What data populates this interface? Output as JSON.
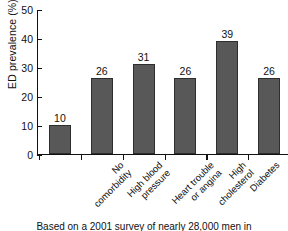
{
  "chart_data": {
    "type": "bar",
    "title": "",
    "xlabel": "",
    "ylabel": "ED prevalence (%)",
    "ylim": [
      0,
      50
    ],
    "yticks": [
      0,
      10,
      20,
      30,
      40,
      50
    ],
    "grid": false,
    "legend": null,
    "bar_color": "#585858",
    "bar_edge_color": "#2e2e2e",
    "categories": [
      "No comorbidity",
      "High blood pressure",
      "Heart trouble or angina",
      "High cholesterol",
      "Diabetes",
      "Depression or anxiety"
    ],
    "category_lines": [
      [
        "No",
        "comorbidity"
      ],
      [
        "High blood",
        "pressure"
      ],
      [
        "Heart trouble",
        "or angina"
      ],
      [
        "High",
        "cholesterol"
      ],
      [
        "Diabetes",
        ""
      ],
      [
        "Depression",
        "or anxiety"
      ]
    ],
    "values": [
      10,
      26,
      31,
      26,
      39,
      26
    ],
    "value_labels": [
      "10",
      "26",
      "31",
      "26",
      "39",
      "26"
    ]
  },
  "caption": {
    "text": "Based on a 2001 survey of nearly 28,000 men in"
  }
}
